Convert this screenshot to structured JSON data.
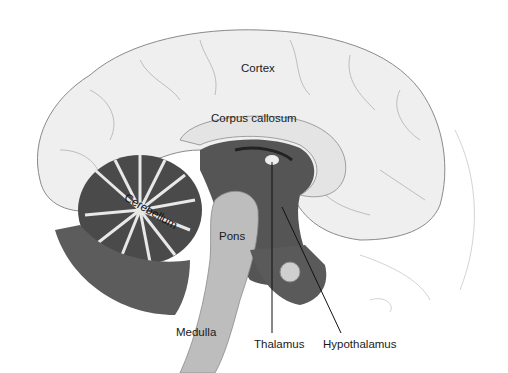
{
  "figure": {
    "colors": {
      "background": "#ffffff",
      "cortex_fill": "#efefef",
      "cortex_line": "#8a8a8a",
      "inner_dark": "#555555",
      "cerebellum_dark": "#4a4a4a",
      "stem_fill": "#bdbdbd",
      "label_text": "#1a1a1a",
      "leader_line": "#111111"
    },
    "labels": [
      {
        "id": "cortex",
        "text": "Cortex",
        "x": 241,
        "y": 63
      },
      {
        "id": "corpus-callosum",
        "text": "Corpus callosum",
        "x": 211,
        "y": 113
      },
      {
        "id": "cerebellum",
        "text": "Cerebellum",
        "x": 128,
        "y": 196
      },
      {
        "id": "pons",
        "text": "Pons",
        "x": 219,
        "y": 231
      },
      {
        "id": "medulla",
        "text": "Medulla",
        "x": 176,
        "y": 327
      },
      {
        "id": "thalamus",
        "text": "Thalamus",
        "x": 254,
        "y": 341
      },
      {
        "id": "hypothalamus",
        "text": "Hypothalamus",
        "x": 323,
        "y": 341
      }
    ],
    "leader_lines": [
      {
        "id": "thalamus-line",
        "x1": 272,
        "y1": 162,
        "x2": 272,
        "y2": 333
      },
      {
        "id": "hypothalamus-line",
        "x1": 282,
        "y1": 207,
        "x2": 341,
        "y2": 333
      }
    ]
  }
}
